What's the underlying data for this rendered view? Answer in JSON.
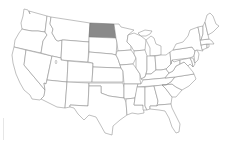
{
  "map": {
    "title": "United States",
    "highlighted_state": "North Dakota",
    "highlight_color": "#8a8a8a",
    "base_fill": "#ffffff",
    "border_color": "#8c8c8c",
    "states": [
      "Washington",
      "Oregon",
      "California",
      "Nevada",
      "Idaho",
      "Montana",
      "Wyoming",
      "Utah",
      "Arizona",
      "Colorado",
      "New Mexico",
      "North Dakota",
      "South Dakota",
      "Nebraska",
      "Kansas",
      "Oklahoma",
      "Texas",
      "Minnesota",
      "Iowa",
      "Missouri",
      "Arkansas",
      "Louisiana",
      "Wisconsin",
      "Illinois",
      "Michigan",
      "Indiana",
      "Ohio",
      "Kentucky",
      "Tennessee",
      "Mississippi",
      "Alabama",
      "Georgia",
      "Florida",
      "South Carolina",
      "North Carolina",
      "Virginia",
      "West Virginia",
      "Pennsylvania",
      "New York",
      "Maryland",
      "Delaware",
      "New Jersey",
      "Connecticut",
      "Rhode Island",
      "Massachusetts",
      "Vermont",
      "New Hampshire",
      "Maine"
    ]
  }
}
